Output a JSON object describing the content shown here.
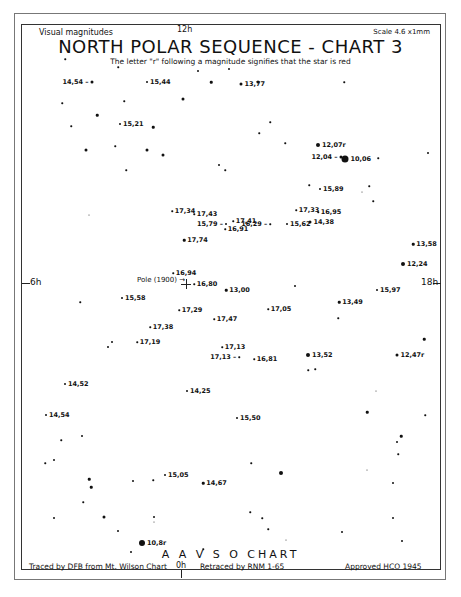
{
  "header": {
    "left": "Visual magnitudes",
    "top_ra": "12h",
    "right": "Scale 4.6 x1mm",
    "title": "NORTH POLAR SEQUENCE - CHART 3",
    "subtitle": "The letter \"r\" following a magnitude signifies that the star is red"
  },
  "axes": {
    "left_ra": "6h",
    "right_ra": "18h",
    "bottom_ra": "0h"
  },
  "pole_label": "Pole (1900) →",
  "footer": {
    "chart_name": "A A V S O CHART",
    "traced": "Traced by DFB from Mt. Wilson Chart",
    "retraced": "Retraced by RNM 1-65",
    "approved": "Approved HCO 1945"
  },
  "labeled_stars": [
    {
      "mag": "14,54 –",
      "x": 92,
      "y": 82,
      "size": 3,
      "label_side": "left"
    },
    {
      "mag": "15,44",
      "x": 147,
      "y": 82,
      "size": 2,
      "label_side": "right"
    },
    {
      "mag": "13,77",
      "x": 241,
      "y": 84,
      "size": 3,
      "label_side": "right"
    },
    {
      "mag": "15,21",
      "x": 120,
      "y": 124,
      "size": 2,
      "label_side": "right"
    },
    {
      "mag": "12,07r",
      "x": 318,
      "y": 145,
      "size": 4,
      "label_side": "right"
    },
    {
      "mag": "12,04 –",
      "x": 341,
      "y": 157,
      "size": 3,
      "label_side": "left"
    },
    {
      "mag": "10,06",
      "x": 345,
      "y": 159,
      "size": 7,
      "label_side": "right"
    },
    {
      "mag": "15,89",
      "x": 320,
      "y": 189,
      "size": 2,
      "label_side": "right"
    },
    {
      "mag": "17,34",
      "x": 172,
      "y": 211,
      "size": 1.5,
      "label_side": "right"
    },
    {
      "mag": "17,43",
      "x": 194,
      "y": 214,
      "size": 1.5,
      "label_side": "right"
    },
    {
      "mag": "15,79 –",
      "x": 226,
      "y": 224,
      "size": 2,
      "label_side": "left"
    },
    {
      "mag": "17,41",
      "x": 233,
      "y": 221,
      "size": 1.5,
      "label_side": "right"
    },
    {
      "mag": "16,91",
      "x": 225,
      "y": 229,
      "size": 1.5,
      "label_side": "right"
    },
    {
      "mag": "16,29 –",
      "x": 270,
      "y": 224,
      "size": 1.5,
      "label_side": "left"
    },
    {
      "mag": "17,33",
      "x": 296,
      "y": 210,
      "size": 1.5,
      "label_side": "right"
    },
    {
      "mag": "16,95",
      "x": 318,
      "y": 212,
      "size": 1.5,
      "label_side": "right"
    },
    {
      "mag": "15,62",
      "x": 287,
      "y": 224,
      "size": 2,
      "label_side": "right"
    },
    {
      "mag": "14,38",
      "x": 310,
      "y": 222,
      "size": 3,
      "label_side": "right"
    },
    {
      "mag": "17,74",
      "x": 184,
      "y": 240,
      "size": 2.5,
      "label_side": "right"
    },
    {
      "mag": "13,58",
      "x": 413,
      "y": 244,
      "size": 2.5,
      "label_side": "right"
    },
    {
      "mag": "12,24",
      "x": 403,
      "y": 264,
      "size": 4,
      "label_side": "right"
    },
    {
      "mag": "16,94",
      "x": 173,
      "y": 273,
      "size": 1.5,
      "label_side": "right"
    },
    {
      "mag": "16,80",
      "x": 194,
      "y": 284,
      "size": 1.5,
      "label_side": "right"
    },
    {
      "mag": "13,00",
      "x": 226,
      "y": 290,
      "size": 2.5,
      "label_side": "right"
    },
    {
      "mag": "15,58",
      "x": 122,
      "y": 298,
      "size": 2,
      "label_side": "right"
    },
    {
      "mag": "15,97",
      "x": 377,
      "y": 290,
      "size": 2,
      "label_side": "right"
    },
    {
      "mag": "13,49",
      "x": 339,
      "y": 302,
      "size": 2.5,
      "label_side": "right"
    },
    {
      "mag": "17,29",
      "x": 179,
      "y": 310,
      "size": 1.5,
      "label_side": "right"
    },
    {
      "mag": "17,05",
      "x": 268,
      "y": 309,
      "size": 1.5,
      "label_side": "right"
    },
    {
      "mag": "17,47",
      "x": 214,
      "y": 319,
      "size": 1.5,
      "label_side": "right"
    },
    {
      "mag": "17,38",
      "x": 150,
      "y": 327,
      "size": 1.5,
      "label_side": "right"
    },
    {
      "mag": "17,19",
      "x": 137,
      "y": 342,
      "size": 1.5,
      "label_side": "right"
    },
    {
      "mag": "17,13",
      "x": 222,
      "y": 347,
      "size": 1.5,
      "label_side": "right"
    },
    {
      "mag": "17,13 –",
      "x": 239,
      "y": 357,
      "size": 1.5,
      "label_side": "left"
    },
    {
      "mag": "16,81",
      "x": 254,
      "y": 359,
      "size": 1.5,
      "label_side": "right"
    },
    {
      "mag": "13,52",
      "x": 308,
      "y": 355,
      "size": 4,
      "label_side": "right"
    },
    {
      "mag": "12,47r",
      "x": 397,
      "y": 355,
      "size": 3,
      "label_side": "right"
    },
    {
      "mag": "14,52",
      "x": 65,
      "y": 384,
      "size": 2,
      "label_side": "right"
    },
    {
      "mag": "14,25",
      "x": 187,
      "y": 391,
      "size": 2,
      "label_side": "right"
    },
    {
      "mag": "14,54",
      "x": 46,
      "y": 415,
      "size": 2,
      "label_side": "right"
    },
    {
      "mag": "15,50",
      "x": 237,
      "y": 418,
      "size": 2,
      "label_side": "right"
    },
    {
      "mag": "15,05",
      "x": 165,
      "y": 475,
      "size": 2,
      "label_side": "right"
    },
    {
      "mag": "14,67",
      "x": 203,
      "y": 483,
      "size": 2.5,
      "label_side": "right"
    },
    {
      "mag": "10,8r",
      "x": 142,
      "y": 543,
      "size": 6,
      "label_side": "right"
    }
  ],
  "field_stars": [
    {
      "x": 65,
      "y": 59,
      "s": 1.5
    },
    {
      "x": 118,
      "y": 67,
      "s": 1.5
    },
    {
      "x": 198,
      "y": 71,
      "s": 2
    },
    {
      "x": 229,
      "y": 69,
      "s": 2
    },
    {
      "x": 211,
      "y": 82,
      "s": 2.5
    },
    {
      "x": 258,
      "y": 82,
      "s": 3
    },
    {
      "x": 183,
      "y": 99,
      "s": 3
    },
    {
      "x": 62,
      "y": 103,
      "s": 1.5
    },
    {
      "x": 124,
      "y": 101,
      "s": 1.5
    },
    {
      "x": 97,
      "y": 115,
      "s": 2.5
    },
    {
      "x": 71,
      "y": 126,
      "s": 1.5
    },
    {
      "x": 153,
      "y": 127,
      "s": 2.5
    },
    {
      "x": 86,
      "y": 150,
      "s": 3
    },
    {
      "x": 115,
      "y": 146,
      "s": 1.5
    },
    {
      "x": 147,
      "y": 150,
      "s": 3
    },
    {
      "x": 163,
      "y": 155,
      "s": 3
    },
    {
      "x": 126,
      "y": 170,
      "s": 1.5
    },
    {
      "x": 89,
      "y": 215,
      "s": 1
    },
    {
      "x": 344,
      "y": 82,
      "s": 1.5
    },
    {
      "x": 270,
      "y": 122,
      "s": 1.5
    },
    {
      "x": 259,
      "y": 133,
      "s": 1.5
    },
    {
      "x": 285,
      "y": 143,
      "s": 1.5
    },
    {
      "x": 219,
      "y": 165,
      "s": 2
    },
    {
      "x": 225,
      "y": 170,
      "s": 1.5
    },
    {
      "x": 378,
      "y": 158,
      "s": 1.5
    },
    {
      "x": 428,
      "y": 153,
      "s": 2
    },
    {
      "x": 309,
      "y": 185,
      "s": 1.5
    },
    {
      "x": 369,
      "y": 186,
      "s": 1.5
    },
    {
      "x": 362,
      "y": 192,
      "s": 1
    },
    {
      "x": 373,
      "y": 201,
      "s": 1.5
    },
    {
      "x": 295,
      "y": 286,
      "s": 2
    },
    {
      "x": 338,
      "y": 318,
      "s": 1.5
    },
    {
      "x": 80,
      "y": 302,
      "s": 1.5
    },
    {
      "x": 112,
      "y": 342,
      "s": 2
    },
    {
      "x": 108,
      "y": 347,
      "s": 2
    },
    {
      "x": 424,
      "y": 339,
      "s": 2.5
    },
    {
      "x": 308,
      "y": 370,
      "s": 1.5
    },
    {
      "x": 315,
      "y": 369,
      "s": 1.5
    },
    {
      "x": 376,
      "y": 391,
      "s": 1
    },
    {
      "x": 367,
      "y": 412,
      "s": 2.5
    },
    {
      "x": 425,
      "y": 415,
      "s": 1.5
    },
    {
      "x": 401,
      "y": 436,
      "s": 2.5
    },
    {
      "x": 397,
      "y": 442,
      "s": 2
    },
    {
      "x": 398,
      "y": 454,
      "s": 1.5
    },
    {
      "x": 367,
      "y": 470,
      "s": 1
    },
    {
      "x": 393,
      "y": 483,
      "s": 2
    },
    {
      "x": 393,
      "y": 518,
      "s": 2
    },
    {
      "x": 342,
      "y": 532,
      "s": 2
    },
    {
      "x": 402,
      "y": 541,
      "s": 2
    },
    {
      "x": 82,
      "y": 436,
      "s": 2
    },
    {
      "x": 54,
      "y": 460,
      "s": 2
    },
    {
      "x": 45,
      "y": 463,
      "s": 1.5
    },
    {
      "x": 89,
      "y": 479,
      "s": 2.5
    },
    {
      "x": 91,
      "y": 487,
      "s": 2.5
    },
    {
      "x": 83,
      "y": 502,
      "s": 1.5
    },
    {
      "x": 54,
      "y": 518,
      "s": 2
    },
    {
      "x": 104,
      "y": 517,
      "s": 3
    },
    {
      "x": 118,
      "y": 531,
      "s": 2
    },
    {
      "x": 133,
      "y": 481,
      "s": 2
    },
    {
      "x": 153,
      "y": 480,
      "s": 1.5
    },
    {
      "x": 154,
      "y": 517,
      "s": 2
    },
    {
      "x": 131,
      "y": 552,
      "s": 2
    },
    {
      "x": 203,
      "y": 549,
      "s": 1.5
    },
    {
      "x": 154,
      "y": 522,
      "s": 1
    },
    {
      "x": 251,
      "y": 463,
      "s": 1.5
    },
    {
      "x": 281,
      "y": 473,
      "s": 4
    },
    {
      "x": 250,
      "y": 512,
      "s": 1.5
    },
    {
      "x": 262,
      "y": 518,
      "s": 1.5
    },
    {
      "x": 268,
      "y": 529,
      "s": 1.5
    },
    {
      "x": 286,
      "y": 540,
      "s": 1
    },
    {
      "x": 61,
      "y": 440,
      "s": 1.5
    }
  ]
}
